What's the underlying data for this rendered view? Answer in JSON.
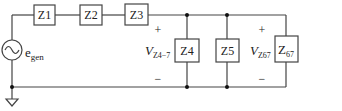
{
  "diagram": {
    "type": "circuit-schematic",
    "source": {
      "label": "e",
      "subscript": "gen",
      "symbol": "ac-voltage-source"
    },
    "series_impedances": [
      {
        "id": "z1",
        "label": "Z1"
      },
      {
        "id": "z2",
        "label": "Z2"
      },
      {
        "id": "z3",
        "label": "Z3"
      }
    ],
    "shunt_impedances": [
      {
        "id": "z4",
        "label": "Z4"
      },
      {
        "id": "z5",
        "label": "Z5"
      },
      {
        "id": "z67",
        "label": "Z",
        "subscript": "67"
      }
    ],
    "voltages": [
      {
        "id": "v-z4-7",
        "label": "V",
        "subscript": "Z4−7",
        "plus": "+",
        "minus": "−"
      },
      {
        "id": "v-z67",
        "label": "V",
        "subscript": "Z67",
        "plus": "+",
        "minus": "−"
      }
    ],
    "ground": {
      "symbol": "ground"
    }
  }
}
